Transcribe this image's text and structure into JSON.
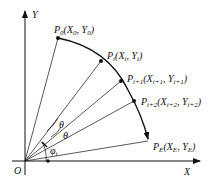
{
  "diagram": {
    "axes": {
      "x_label": "X",
      "y_label": "Y",
      "origin_label": "O"
    },
    "points": [
      {
        "name": "P",
        "sub": "0",
        "coords": "(X",
        "coord_x_sub": "0",
        "coords_mid": ", Y",
        "coord_y_sub": "0",
        "coords_end": ")"
      },
      {
        "name": "P",
        "sub": "i",
        "coords": "(X",
        "coord_x_sub": "i",
        "coords_mid": ", Y",
        "coord_y_sub": "i",
        "coords_end": ")"
      },
      {
        "name": "P",
        "sub": "i+1",
        "coords": "(X",
        "coord_x_sub": "i+1",
        "coords_mid": ", Y",
        "coord_y_sub": "i+1",
        "coords_end": ")"
      },
      {
        "name": "P",
        "sub": "i+2",
        "coords": "(X",
        "coord_x_sub": "i+2",
        "coords_mid": ", Y",
        "coord_y_sub": "i+2",
        "coords_end": ")"
      },
      {
        "name": "P",
        "sub": "E",
        "coords": "(X",
        "coord_x_sub": "E",
        "coords_mid": ", Y",
        "coord_y_sub": "E",
        "coords_end": ")"
      }
    ],
    "angles": {
      "theta1": "θ",
      "theta2": "θ",
      "phi": "φ",
      "phi_sub": "i"
    },
    "colors": {
      "stroke": "#111111",
      "background": "#ffffff"
    }
  }
}
